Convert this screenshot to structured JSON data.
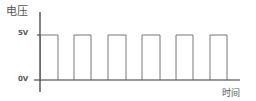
{
  "diagram": {
    "y_axis_label": "电压",
    "x_axis_label": "时间",
    "y_ticks": [
      {
        "label": "5V",
        "level": "high"
      },
      {
        "label": "0V",
        "level": "low"
      }
    ],
    "pulse_count": 6,
    "colors": {
      "axis": "#333333",
      "pulse": "#555555",
      "text": "#555555"
    }
  }
}
